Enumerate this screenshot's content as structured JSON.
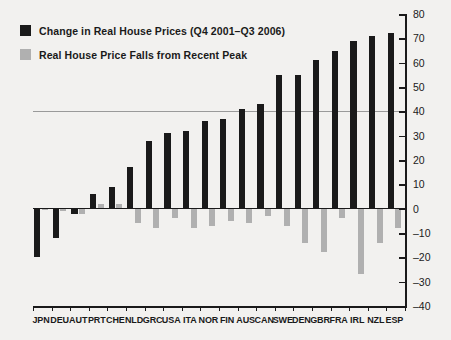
{
  "chart_data": {
    "type": "bar",
    "title": "",
    "xlabel": "",
    "ylabel": "",
    "ylim": [
      -40,
      80
    ],
    "ytick_step": 10,
    "yticks": [
      80,
      70,
      60,
      50,
      40,
      30,
      20,
      10,
      0,
      -10,
      -20,
      -30,
      -40
    ],
    "ytick_labels": [
      "80",
      "70",
      "60",
      "50",
      "40",
      "30",
      "20",
      "10",
      "0",
      "–10",
      "–20",
      "–30",
      "–40"
    ],
    "gridlines": [
      40
    ],
    "grid": false,
    "legend_position": "top-left",
    "categories": [
      "JPN",
      "DEU",
      "AUT",
      "PRT",
      "CHE",
      "NLD",
      "GRC",
      "USA",
      "ITA",
      "NOR",
      "FIN",
      "AUS",
      "CAN",
      "SWE",
      "DEN",
      "GBR",
      "FRA",
      "IRL",
      "NZL",
      "ESP"
    ],
    "series": [
      {
        "name": "Change in Real House Prices (Q4 2001–Q3 2006)",
        "color": "#1a1a1a",
        "values": [
          -20,
          -12,
          -2,
          6,
          9,
          17,
          28,
          31,
          32,
          36,
          37,
          41,
          43,
          55,
          55,
          61,
          65,
          69,
          71,
          72
        ]
      },
      {
        "name": "Real House Price Falls from Recent Peak",
        "color": "#b0b0b0",
        "values": [
          0,
          -1,
          -2,
          2,
          2,
          -6,
          -8,
          -4,
          -8,
          -7,
          -5,
          -6,
          -3,
          -7,
          -14,
          -18,
          -4,
          -27,
          -14,
          -8
        ]
      }
    ]
  },
  "legend": {
    "items": [
      {
        "label": "Change in Real House Prices (Q4 2001–Q3 2006)",
        "color": "#1a1a1a"
      },
      {
        "label": "Real House Price Falls from Recent Peak",
        "color": "#b0b0b0"
      }
    ]
  },
  "colors": {
    "background": "#f2f1ef",
    "series_black": "#1a1a1a",
    "series_gray": "#b0b0b0",
    "axis": "#1a1a1a",
    "gridline": "#9a9a9a"
  }
}
